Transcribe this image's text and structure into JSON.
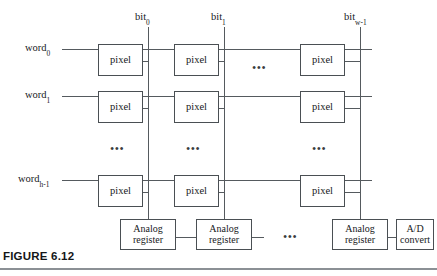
{
  "figure": {
    "caption": "FIGURE 6.12"
  },
  "diagram": {
    "type": "schematic",
    "row_label_prefix": "word",
    "column_label_prefix": "bit",
    "rows": [
      {
        "id": "word0",
        "label_base": "word",
        "label_sub": "0",
        "y": 49
      },
      {
        "id": "word1",
        "label_base": "word",
        "label_sub": "1",
        "y": 96
      },
      {
        "id": "wordh1",
        "label_base": "word",
        "label_sub": "h-1",
        "y": 180
      }
    ],
    "columns": [
      {
        "id": "bit0",
        "label_base": "bit",
        "label_sub": "0",
        "x": 148
      },
      {
        "id": "bit1",
        "label_base": "bit",
        "label_sub": "1",
        "x": 224
      },
      {
        "id": "bitw1",
        "label_base": "bit",
        "label_sub": "w-1",
        "x": 360
      }
    ],
    "cell_label": "pixel",
    "register_label_line1": "Analog",
    "register_label_line2": "register",
    "adc_label_line1": "A/D",
    "adc_label_line2": "convert",
    "ellipsis_glyph": "•••",
    "row_ellipsis_label": "•••",
    "column_ellipsis_label": "•••",
    "counts": {
      "pixel_cells_drawn": 9,
      "analog_registers_drawn": 3,
      "adc_units": 1
    },
    "colors": {
      "line": "#555a5e",
      "box_border": "#4a4f53",
      "text": "#17191b",
      "background": "#ffffff",
      "caption_rule": "#8b9095"
    }
  }
}
